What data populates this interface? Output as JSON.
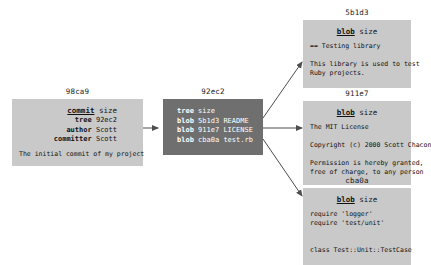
{
  "diagram": {
    "colors": {
      "light_box": "#c9c9c9",
      "dark_box": "#6f6f6f",
      "arrow": "#4d4d4d",
      "label_text": "#1a1a1a",
      "light_box_text": "#111111",
      "dark_box_text": "#ffffff",
      "background": "#ffffff"
    }
  },
  "commit": {
    "id": "98ca9",
    "header_keyword": "commit",
    "header_value": "size",
    "fields": [
      {
        "key": "tree",
        "value": "92ec2"
      },
      {
        "key": "author",
        "value": "Scott"
      },
      {
        "key": "committer",
        "value": "Scott"
      }
    ],
    "message": "The initial commit of my project"
  },
  "tree": {
    "id": "92ec2",
    "header_keyword": "tree",
    "header_value": "size",
    "entries": [
      {
        "key": "blob",
        "hash": "5b1d3",
        "name": "README"
      },
      {
        "key": "blob",
        "hash": "911e7",
        "name": "LICENSE"
      },
      {
        "key": "blob",
        "hash": "cba0a",
        "name": "test.rb"
      }
    ]
  },
  "blobs": [
    {
      "id": "5b1d3",
      "header_keyword": "blob",
      "header_value": "size",
      "lines": [
        "== Testing library",
        "",
        "This library is used to test",
        "Ruby projects."
      ]
    },
    {
      "id": "911e7",
      "header_keyword": "blob",
      "header_value": "size",
      "lines": [
        "The MIT License",
        "",
        "Copyright (c) 2000 Scott Chacon",
        "",
        "Permission is hereby granted,",
        "free of charge, to any person"
      ]
    },
    {
      "id": "cba0a",
      "header_keyword": "blob",
      "header_value": "size",
      "lines": [
        "require 'logger'",
        "require 'test/unit'",
        "",
        "",
        "class Test::Unit::TestCase"
      ]
    }
  ]
}
